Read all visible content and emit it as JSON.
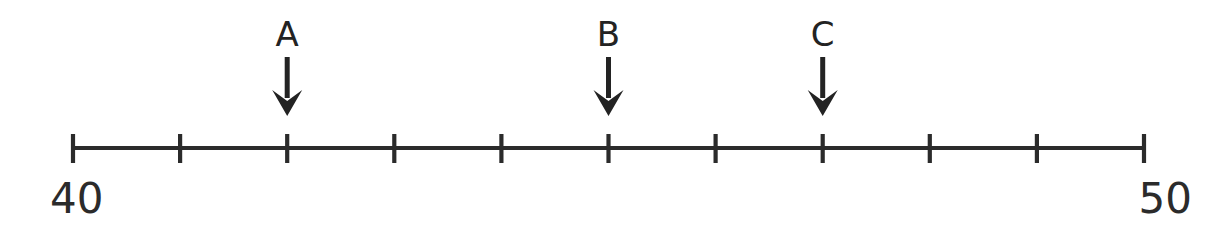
{
  "figure": {
    "kind": "number-line-diagram",
    "background_color": "#ffffff",
    "stroke_color": "#2b2b2b",
    "arrow_color": "#232323"
  },
  "chart_data": {
    "type": "line",
    "title": "",
    "subtitle": "",
    "xlabel": "",
    "ylabel": "",
    "orientation": "horizontal",
    "axis_kind": "number-line",
    "xlim": [
      40,
      50
    ],
    "grid": false,
    "legend": null,
    "tick_interval": 1,
    "tick_count": 11,
    "tick_values": [
      40,
      41,
      42,
      43,
      44,
      45,
      46,
      47,
      48,
      49,
      50
    ],
    "tick_labels_shown": [
      "40",
      "50"
    ],
    "endpoint_labels": {
      "left": "40",
      "right": "50"
    },
    "annotations": [
      {
        "label": "A",
        "value": 42,
        "marker": "down-arrow"
      },
      {
        "label": "B",
        "value": 45,
        "marker": "down-arrow"
      },
      {
        "label": "C",
        "value": 47,
        "marker": "down-arrow"
      }
    ],
    "series": [
      {
        "name": "pointer-markers",
        "values": [
          42,
          45,
          47
        ],
        "labels": [
          "A",
          "B",
          "C"
        ]
      }
    ]
  },
  "geometry": {
    "axis_y": 148,
    "axis_x_start": 73,
    "axis_x_end": 1144,
    "tick_top": 134,
    "tick_bottom": 163,
    "arrow_shaft_top": 57,
    "arrow_tip_y": 116,
    "arrow_label_y": 46,
    "endpoint_label_y": 213,
    "endpoint_left_x": 50,
    "endpoint_right_x": 1192
  },
  "labels": {
    "a": "A",
    "b": "B",
    "c": "C",
    "left_end": "40",
    "right_end": "50"
  }
}
